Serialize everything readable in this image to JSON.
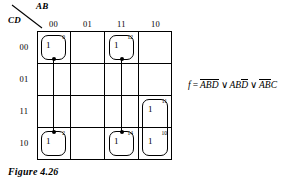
{
  "figure": {
    "caption": "Figure 4.26",
    "type": "karnaugh-map"
  },
  "axes": {
    "column_variables": "AB",
    "row_variables": "CD",
    "column_headers": [
      "00",
      "01",
      "11",
      "10"
    ],
    "row_headers": [
      "00",
      "01",
      "11",
      "10"
    ]
  },
  "cells": [
    {
      "row": "00",
      "col": "00",
      "value": "1",
      "index": "0"
    },
    {
      "row": "00",
      "col": "11",
      "value": "1",
      "index": "12"
    },
    {
      "row": "11",
      "col": "10",
      "value": "1",
      "index": "11"
    },
    {
      "row": "10",
      "col": "00",
      "value": "1",
      "index": "2"
    },
    {
      "row": "10",
      "col": "11",
      "value": "1",
      "index": "14"
    },
    {
      "row": "10",
      "col": "10",
      "value": "1",
      "index": "10"
    }
  ],
  "groups": [
    {
      "name": "group-ab-bar-d-bar",
      "cells": [
        "0",
        "2"
      ],
      "wraps": true
    },
    {
      "name": "group-ab-d-bar",
      "cells": [
        "12",
        "14"
      ],
      "wraps": true
    },
    {
      "name": "group-a-bar-b-c",
      "cells": [
        "11",
        "10"
      ],
      "wraps": false
    }
  ],
  "formula": {
    "function_symbol": "f",
    "equals": "=",
    "terms": [
      {
        "literals": [
          {
            "var": "A",
            "bar": true
          },
          {
            "var": "B",
            "bar": true
          },
          {
            "var": "D",
            "bar": true
          }
        ]
      },
      {
        "literals": [
          {
            "var": "A",
            "bar": false
          },
          {
            "var": "B",
            "bar": false
          },
          {
            "var": "D",
            "bar": true
          }
        ]
      },
      {
        "literals": [
          {
            "var": "A",
            "bar": true
          },
          {
            "var": "B",
            "bar": true
          },
          {
            "var": "C",
            "bar": false
          }
        ]
      }
    ],
    "operator": "∨",
    "text": "f = A̅B̅D̅ ∨ ABD̅ ∨ A̅B̅C"
  },
  "colors": {
    "ink": "#000000",
    "paper": "#ffffff"
  }
}
